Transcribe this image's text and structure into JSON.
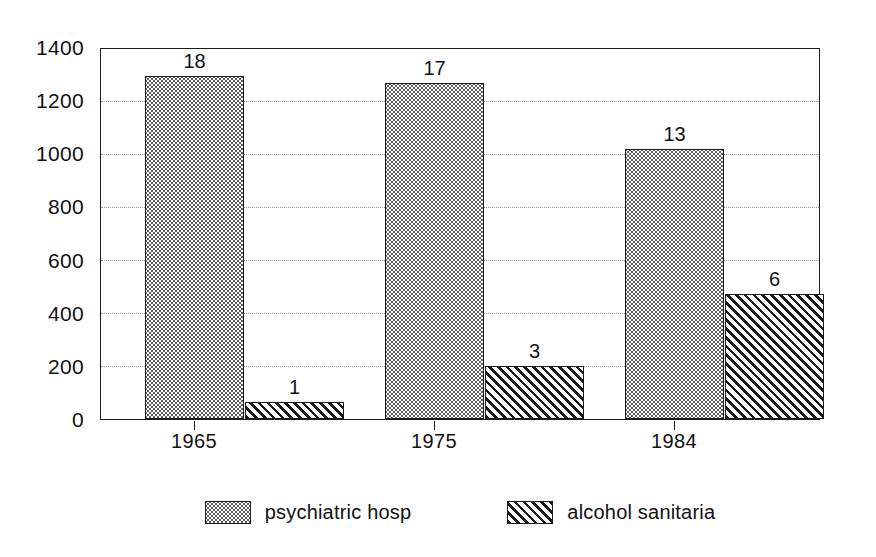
{
  "chart_data": {
    "type": "bar",
    "title": "",
    "xlabel": "",
    "ylabel": "",
    "categories": [
      "1965",
      "1975",
      "1984"
    ],
    "series": [
      {
        "name": "psychiatric hosp",
        "pattern": "dotted",
        "values": [
          1290,
          1265,
          1015
        ],
        "data_labels": [
          "18",
          "17",
          "13"
        ]
      },
      {
        "name": "alcohol sanitaria",
        "pattern": "hatched",
        "values": [
          65,
          200,
          470
        ],
        "data_labels": [
          "1",
          "3",
          "6"
        ]
      }
    ],
    "ylim": [
      0,
      1400
    ],
    "yticks": [
      0,
      200,
      400,
      600,
      800,
      1000,
      1200,
      1400
    ],
    "ytick_labels": [
      "0",
      "200",
      "400",
      "600",
      "800",
      "1000",
      "1200",
      "1400"
    ],
    "gridlines": [
      200,
      400,
      600,
      800,
      1000,
      1200
    ],
    "grid": true,
    "legend_position": "bottom",
    "colors": {
      "axis": "#1a1a1a",
      "grid": "#9a9a9a",
      "text": "#111111",
      "background": "#ffffff",
      "dotted_fill": "#5d5d5d",
      "hatched_fill": "#1a1a1a"
    }
  },
  "legend": {
    "items": [
      {
        "label": "psychiatric hosp",
        "pattern": "dotted"
      },
      {
        "label": "alcohol sanitaria",
        "pattern": "hatched"
      }
    ]
  }
}
